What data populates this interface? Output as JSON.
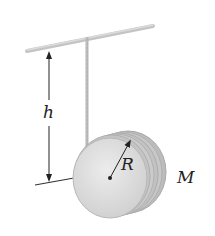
{
  "figure": {
    "type": "physics-diagram",
    "labels": {
      "height": "h",
      "radius": "R",
      "mass": "M"
    },
    "colors": {
      "bar": "#c4c4c4",
      "string": "#b8b8b8",
      "disk_face": "#dedede",
      "disk_rim": "#bdbdbd",
      "arrow": "#222222"
    }
  }
}
